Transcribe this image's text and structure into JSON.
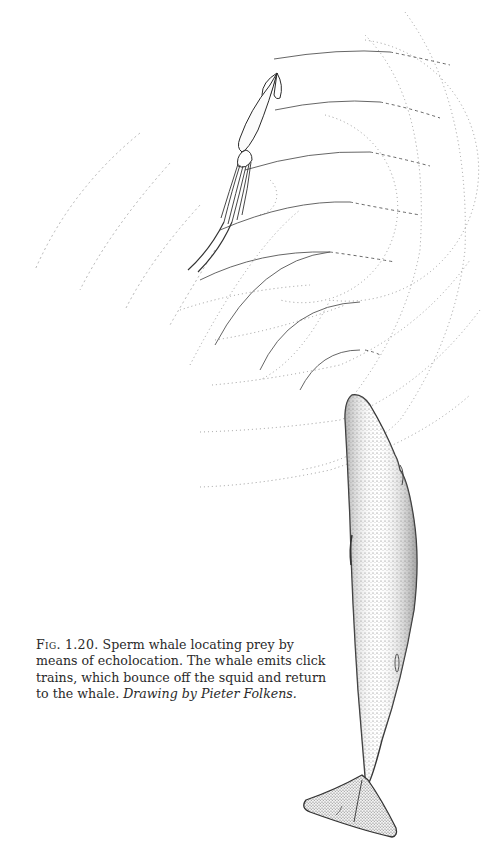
{
  "figure": {
    "label": "Fig. 1.20.",
    "caption": "Sperm whale locating prey by means of echolocation. The whale emits click trains, which bounce off the squid and return to the whale.",
    "credit": "Drawing by Pieter Folkens.",
    "subjects": [
      "squid",
      "sperm-whale",
      "sonar-arcs-outgoing",
      "sonar-arcs-returning"
    ],
    "colors": {
      "ink": "#2a2a2a",
      "stipple": "#555555",
      "dotted": "#9a9a9a",
      "background": "#ffffff"
    }
  }
}
